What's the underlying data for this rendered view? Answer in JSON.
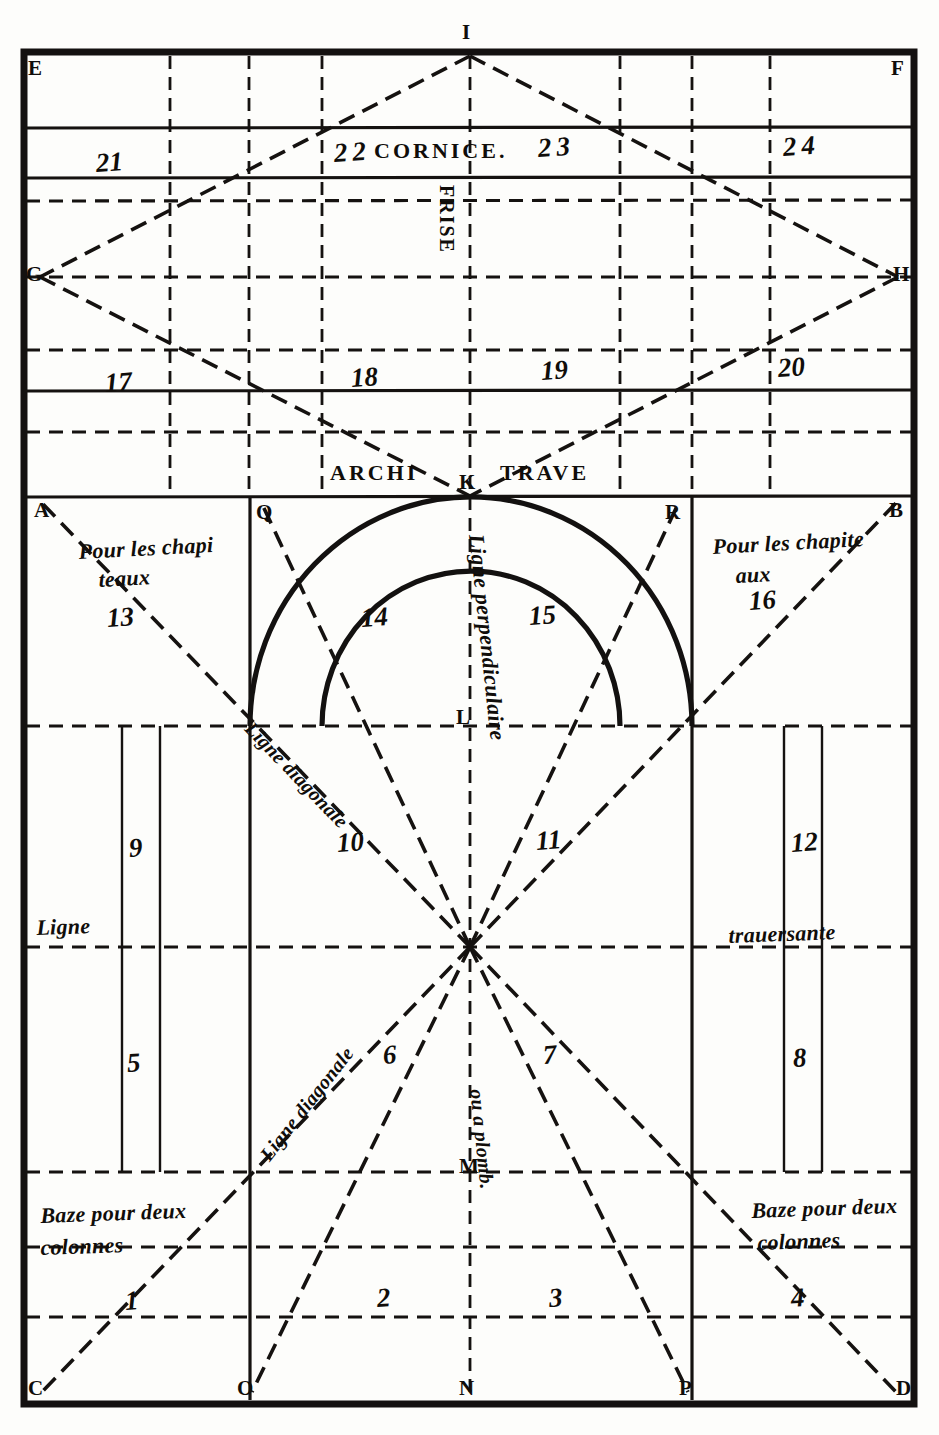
{
  "plate": {
    "title": "Plate of architectural proportions",
    "width": 939,
    "height": 1435,
    "ink_color": "#100d0a",
    "paper_color": "#fdfdfb"
  },
  "inscriptions": {
    "cornice": "CORNICE.",
    "frise": "FRISE",
    "architrave_left": "ARCHI",
    "architrave_right": "TRAVE"
  },
  "corner_points": {
    "E": "E",
    "F": "F",
    "I": "I",
    "G": "G",
    "H": "H",
    "K": "K",
    "A": "A",
    "B": "B",
    "Q": "Q",
    "R": "R",
    "L": "L",
    "M": "M",
    "N": "N",
    "O": "O",
    "P": "P",
    "C": "C",
    "D": "D"
  },
  "annotations": {
    "chapiteaux_left_line1": "Pour les chapi",
    "chapiteaux_left_line2": "teaux",
    "chapiteaux_right_line1": "Pour les chapite",
    "chapiteaux_right_line2": "aux",
    "ligne_diagonale_upper": "Ligne diagonale",
    "ligne_diagonale_lower": "Ligne diagonale",
    "ligne_perpendiculaire": "Ligne perpendiculaire",
    "ligne": "Ligne",
    "trauersante": "trauersante",
    "ou_a_plomb": "ou a plomb.",
    "baze_left_line1": "Baze pour deux",
    "baze_left_line2": "colonnes",
    "baze_right_line1": "Baze pour deux",
    "baze_right_line2": "colonnes"
  },
  "numbers": {
    "n1": "1",
    "n2": "2",
    "n3": "3",
    "n4": "4",
    "n5": "5",
    "n6": "6",
    "n7": "7",
    "n8": "8",
    "n9": "9",
    "n10": "10",
    "n11": "11",
    "n12": "12",
    "n13": "13",
    "n14": "14",
    "n15": "15",
    "n16": "16",
    "n17": "17",
    "n18": "18",
    "n19": "19",
    "n20": "20",
    "n21": "21",
    "n22": "22",
    "n23": "23",
    "n24": "24"
  }
}
